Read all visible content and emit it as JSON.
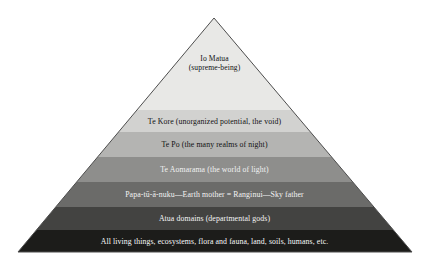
{
  "diagram": {
    "type": "pyramid",
    "title": "",
    "background_color": "#ffffff",
    "outline_color": "#4d4d4d",
    "apex": {
      "x": 214,
      "y": 18
    },
    "base_left": {
      "x": 18,
      "y": 252
    },
    "base_right": {
      "x": 412,
      "y": 252
    },
    "tier_count": 7,
    "tiers": [
      {
        "index": 1,
        "lines": [
          "Io Matua",
          "(supreme-being)"
        ],
        "fill": "#e8e8e6",
        "text_color": "#111111",
        "y_top": 18,
        "y_bottom": 110,
        "font_size": 7.6
      },
      {
        "index": 2,
        "lines": [
          "Te Kore (unorganized potential, the void)"
        ],
        "fill": "#d2d2d0",
        "text_color": "#111111",
        "y_top": 110,
        "y_bottom": 132,
        "font_size": 7.8
      },
      {
        "index": 3,
        "lines": [
          "Te Po (the many realms of night)"
        ],
        "fill": "#b4b4b2",
        "text_color": "#111111",
        "y_top": 132,
        "y_bottom": 157,
        "font_size": 7.8
      },
      {
        "index": 4,
        "lines": [
          "Te Aomarama (the world of light)"
        ],
        "fill": "#8e8e8c",
        "text_color": "#f2f2f2",
        "y_top": 157,
        "y_bottom": 182,
        "font_size": 7.8
      },
      {
        "index": 5,
        "lines": [
          "Papa-tū-ā-nuku—Earth mother = Ranginui—Sky father"
        ],
        "fill": "#6b6b69",
        "text_color": "#f4f4f4",
        "y_top": 182,
        "y_bottom": 207,
        "font_size": 7.8
      },
      {
        "index": 6,
        "lines": [
          "Atua domains (departmental gods)"
        ],
        "fill": "#434341",
        "text_color": "#f6f6f6",
        "y_top": 207,
        "y_bottom": 230,
        "font_size": 7.8
      },
      {
        "index": 7,
        "lines": [
          "All living things, ecosystems, flora and fauna, land, soils, humans, etc."
        ],
        "fill": "#1c1c1a",
        "text_color": "#fafafa",
        "y_top": 230,
        "y_bottom": 252,
        "font_size": 7.8
      }
    ]
  }
}
